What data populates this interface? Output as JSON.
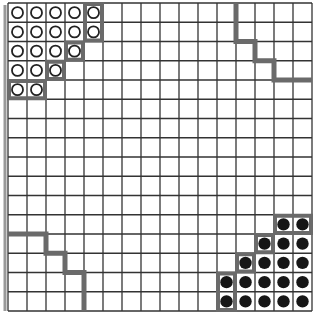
{
  "caption": "",
  "grid": {
    "rows": 16,
    "cols": 16,
    "origin_x": 8,
    "origin_y": 3,
    "cell_w": 19,
    "cell_h": 19.25,
    "line_color": "#333333",
    "thick_color": "#6a6a6a",
    "outer_left_color": "#999999"
  },
  "pieces": {
    "open_circles": [
      [
        0,
        0
      ],
      [
        0,
        1
      ],
      [
        0,
        2
      ],
      [
        0,
        3
      ],
      [
        0,
        4
      ],
      [
        1,
        0
      ],
      [
        1,
        1
      ],
      [
        1,
        2
      ],
      [
        1,
        3
      ],
      [
        1,
        4
      ],
      [
        2,
        0
      ],
      [
        2,
        1
      ],
      [
        2,
        2
      ],
      [
        2,
        3
      ],
      [
        3,
        0
      ],
      [
        3,
        1
      ],
      [
        3,
        2
      ],
      [
        4,
        0
      ],
      [
        4,
        1
      ]
    ],
    "filled_dots": [
      [
        11,
        14
      ],
      [
        11,
        15
      ],
      [
        12,
        13
      ],
      [
        12,
        14
      ],
      [
        12,
        15
      ],
      [
        13,
        12
      ],
      [
        13,
        13
      ],
      [
        13,
        14
      ],
      [
        13,
        15
      ],
      [
        14,
        11
      ],
      [
        14,
        12
      ],
      [
        14,
        13
      ],
      [
        14,
        14
      ],
      [
        14,
        15
      ],
      [
        15,
        11
      ],
      [
        15,
        12
      ],
      [
        15,
        13
      ],
      [
        15,
        14
      ],
      [
        15,
        15
      ]
    ]
  },
  "frontier_boxes": [
    {
      "row": 0,
      "col": 4,
      "h": 2,
      "w": 1
    },
    {
      "row": 2,
      "col": 3,
      "h": 1,
      "w": 1
    },
    {
      "row": 3,
      "col": 2,
      "h": 1,
      "w": 1
    },
    {
      "row": 4,
      "col": 0,
      "h": 1,
      "w": 2
    },
    {
      "row": 11,
      "col": 14,
      "h": 1,
      "w": 2
    },
    {
      "row": 12,
      "col": 13,
      "h": 1,
      "w": 1
    },
    {
      "row": 13,
      "col": 12,
      "h": 1,
      "w": 1
    },
    {
      "row": 14,
      "col": 11,
      "h": 2,
      "w": 1
    }
  ],
  "staircases": [
    {
      "name": "top-right-boundary",
      "points": [
        [
          12,
          0
        ],
        [
          12,
          2
        ],
        [
          13,
          2
        ],
        [
          13,
          3
        ],
        [
          14,
          3
        ],
        [
          14,
          4
        ],
        [
          16,
          4
        ]
      ]
    },
    {
      "name": "bottom-left-boundary",
      "points": [
        [
          0,
          12
        ],
        [
          2,
          12
        ],
        [
          2,
          13
        ],
        [
          3,
          13
        ],
        [
          3,
          14
        ],
        [
          4,
          14
        ],
        [
          4,
          16
        ]
      ]
    }
  ]
}
